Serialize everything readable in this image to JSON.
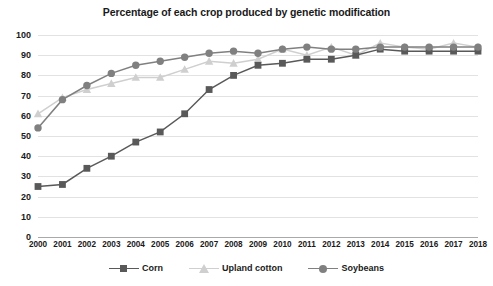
{
  "chart_data": {
    "type": "line",
    "title": "Percentage of each crop produced by genetic modification",
    "xlabel": "",
    "ylabel": "",
    "ylim": [
      0,
      100
    ],
    "ytick_step": 10,
    "grid": true,
    "legend_position": "bottom",
    "categories": [
      "2000",
      "2001",
      "2002",
      "2003",
      "2004",
      "2005",
      "2006",
      "2007",
      "2008",
      "2009",
      "2010",
      "2011",
      "2012",
      "2013",
      "2014",
      "2015",
      "2016",
      "2017",
      "2018"
    ],
    "yticks": [
      "0",
      "10",
      "20",
      "30",
      "40",
      "50",
      "60",
      "70",
      "80",
      "90",
      "100"
    ],
    "series": [
      {
        "name": "Corn",
        "color": "#595959",
        "marker": "square",
        "values": [
          25,
          26,
          34,
          40,
          47,
          52,
          61,
          73,
          80,
          85,
          86,
          88,
          88,
          90,
          93,
          92,
          92,
          92,
          92
        ]
      },
      {
        "name": "Upland cotton",
        "color": "#cfcfcf",
        "marker": "triangle",
        "values": [
          61,
          69,
          73,
          76,
          79,
          79,
          83,
          87,
          86,
          88,
          93,
          90,
          94,
          90,
          96,
          94,
          93,
          96,
          94
        ]
      },
      {
        "name": "Soybeans",
        "color": "#808080",
        "marker": "circle",
        "values": [
          54,
          68,
          75,
          81,
          85,
          87,
          89,
          91,
          92,
          91,
          93,
          94,
          93,
          93,
          94,
          94,
          94,
          94,
          94
        ]
      }
    ]
  },
  "legend": {
    "items": [
      {
        "label": "Corn"
      },
      {
        "label": "Upland cotton"
      },
      {
        "label": "Soybeans"
      }
    ]
  },
  "colors": {
    "corn": "#595959",
    "cotton": "#cfcfcf",
    "soybeans": "#808080",
    "gridline": "#e2e2e2",
    "axis": "#a9a9a9",
    "text": "#1a1a1a",
    "background": "#ffffff"
  }
}
